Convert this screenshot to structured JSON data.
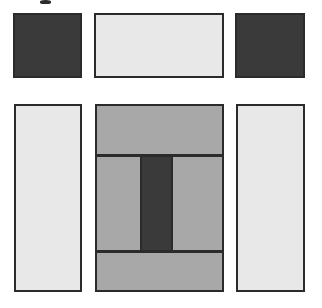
{
  "figure": {
    "canvas": {
      "width": 322,
      "height": 308,
      "background": "#ffffff"
    },
    "palette": {
      "dark": "#3a3a3a",
      "mid_gray": "#a8a8a8",
      "light": "#e8e8e8",
      "outline": "#2b2b2b",
      "background": "#ffffff"
    },
    "top_row": {
      "label": "top row",
      "cells": [
        {
          "name": "top-left-dark-square",
          "tone": "dark",
          "x": 13,
          "y": 13,
          "w": 69,
          "h": 65
        },
        {
          "name": "top-center-light-rect",
          "tone": "light",
          "x": 94,
          "y": 13,
          "w": 130,
          "h": 65
        },
        {
          "name": "top-right-dark-square",
          "tone": "dark",
          "x": 235,
          "y": 13,
          "w": 70,
          "h": 65
        }
      ]
    },
    "bottom_row": {
      "label": "bottom row",
      "cells": [
        {
          "name": "bottom-left-light-rect",
          "tone": "light",
          "x": 14,
          "y": 104,
          "w": 68,
          "h": 188
        },
        {
          "name": "bottom-center-composite",
          "tone": "mid_gray",
          "x": 95,
          "y": 104,
          "w": 129,
          "h": 188
        },
        {
          "name": "bottom-right-light-rect",
          "tone": "light",
          "x": 236,
          "y": 104,
          "w": 69,
          "h": 188
        }
      ]
    },
    "composite_detail": {
      "label": "center composite panel",
      "bands": [
        {
          "name": "upper-band",
          "tone": "mid_gray",
          "top": 0,
          "height": 48
        },
        {
          "name": "middle-band",
          "tone": "mid_gray",
          "top": 52,
          "height": 91
        },
        {
          "name": "lower-band",
          "tone": "mid_gray",
          "top": 147,
          "height": 41
        }
      ],
      "dividers": [
        {
          "name": "upper-divider",
          "top": 48,
          "thickness": 3
        },
        {
          "name": "lower-divider",
          "top": 144,
          "thickness": 3
        }
      ],
      "inner_bar": {
        "name": "center-dark-bar",
        "tone": "dark",
        "left": 43,
        "top": 51,
        "width": 33,
        "height": 93
      }
    },
    "glyph_mark": {
      "name": "cropped-glyph-remnant",
      "x": 40,
      "y": 0,
      "w": 11,
      "h": 4
    }
  }
}
